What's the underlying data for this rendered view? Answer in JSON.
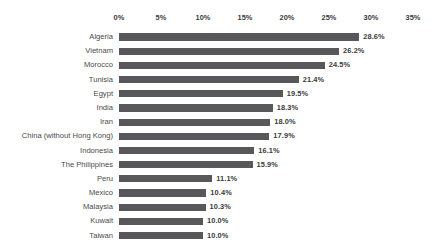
{
  "chart_data": {
    "type": "bar",
    "orientation": "horizontal",
    "title": "",
    "subtitle": "",
    "xlabel": "",
    "ylabel": "",
    "xlim": [
      0,
      35
    ],
    "xtick_labels": [
      "0%",
      "5%",
      "10%",
      "15%",
      "20%",
      "25%",
      "30%",
      "35%"
    ],
    "xticks": [
      0,
      5,
      10,
      15,
      20,
      25,
      30,
      35
    ],
    "grid": false,
    "legend": false,
    "value_label_suffix": "%",
    "categories": [
      "Algeria",
      "Vietnam",
      "Morocco",
      "Tunisia",
      "Egypt",
      "India",
      "Iran",
      "China (without Hong Kong)",
      "Indonesia",
      "The Philippines",
      "Peru",
      "Mexico",
      "Malaysia",
      "Kuwait",
      "Taiwan"
    ],
    "values": [
      28.6,
      26.2,
      24.5,
      21.4,
      19.5,
      18.3,
      18.0,
      17.9,
      16.1,
      15.9,
      11.1,
      10.4,
      10.3,
      10.0,
      10.0
    ],
    "value_labels": [
      "28.6%",
      "26.2%",
      "24.5%",
      "21.4%",
      "19.5%",
      "18.3%",
      "18.0%",
      "17.9%",
      "16.1%",
      "15.9%",
      "11.1%",
      "10.4%",
      "10.3%",
      "10.0%",
      "10.0%"
    ],
    "colors": {
      "bar": "#58585a",
      "background": "#ffffff",
      "tick_text": "#3b3b3d",
      "category_text": "#4a4a4c",
      "value_text": "#3b3b3d"
    }
  }
}
